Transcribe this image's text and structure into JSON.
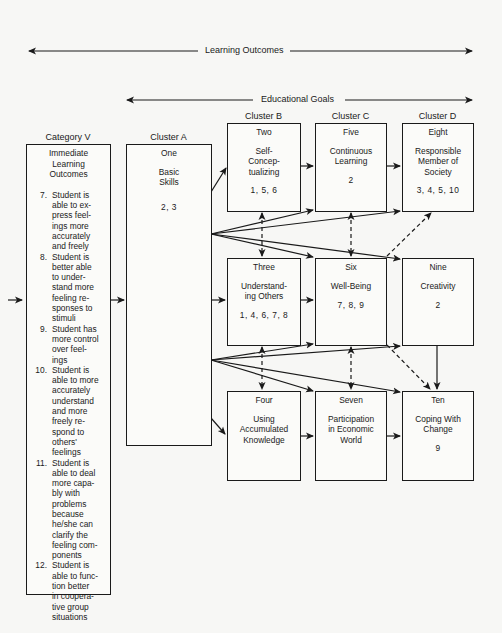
{
  "header": {
    "learning_outcomes_label": "Learning Outcomes",
    "educational_goals_label": "Educational Goals"
  },
  "columns": {
    "category_v": "Category V",
    "cluster_a": "Cluster A",
    "cluster_b": "Cluster B",
    "cluster_c": "Cluster C",
    "cluster_d": "Cluster D"
  },
  "category_v_box": {
    "heading": "Immediate\nLearning\nOutcomes",
    "outcomes": [
      {
        "number": "7.",
        "text": "Student is\nable to ex-\npress feel-\nings more\naccurately\nand freely"
      },
      {
        "number": "8.",
        "text": "Student is\nbetter able\nto under-\nstand more\nfeeling re-\nsponses to\nstimuli"
      },
      {
        "number": "9.",
        "text": "Student has\nmore control\nover feel-\nings"
      },
      {
        "number": "10.",
        "text": "Student is\nable to more\naccurately\nunderstand\nand more\nfreely re-\nspond to\nothers'\nfeelings"
      },
      {
        "number": "11.",
        "text": "Student is\nable to deal\nmore capa-\nbly with\nproblems\nbecause\nhe/she can\nclarify the\nfeeling com-\nponents"
      },
      {
        "number": "12.",
        "text": "Student is\nable to func-\ntion better\nin coopera-\ntive group\nsituations"
      }
    ]
  },
  "goals": {
    "one": {
      "number": "One",
      "title": "Basic\nSkills",
      "refs": "2, 3"
    },
    "two": {
      "number": "Two",
      "title": "Self-\nConcep-\ntualizing",
      "refs": "1, 5, 6"
    },
    "five": {
      "number": "Five",
      "title": "Continuous\nLearning",
      "refs": "2"
    },
    "eight": {
      "number": "Eight",
      "title": "Responsible\nMember of\nSociety",
      "refs": "3, 4, 5, 10"
    },
    "three": {
      "number": "Three",
      "title": "Understand-\ning Others",
      "refs": "1, 4, 6, 7, 8"
    },
    "six": {
      "number": "Six",
      "title": "Well-Being",
      "refs": "7, 8, 9"
    },
    "nine": {
      "number": "Nine",
      "title": "Creativity",
      "refs": "2"
    },
    "four": {
      "number": "Four",
      "title": "Using\nAccumulated\nKnowledge",
      "refs": ""
    },
    "seven": {
      "number": "Seven",
      "title": "Participation\nin Economic\nWorld",
      "refs": ""
    },
    "ten": {
      "number": "Ten",
      "title": "Coping With\nChange",
      "refs": "9"
    }
  },
  "colors": {
    "ink": "#1a1a1a",
    "paper": "#f7f7f5"
  }
}
